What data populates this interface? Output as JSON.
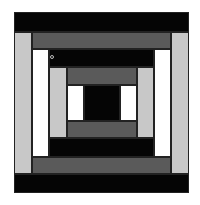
{
  "diagram": {
    "title": "",
    "type": "quilt-block-courthouse-steps",
    "colors": {
      "black": "#050505",
      "dark_gray": "#5a5a5a",
      "light_gray": "#c8c8c8",
      "white": "#ffffff"
    },
    "pieces": [
      {
        "name": "outer-top-black",
        "x": 14,
        "y": 12,
        "w": 175,
        "h": 20,
        "color": "#050505"
      },
      {
        "name": "outer-bottom-black",
        "x": 14,
        "y": 174,
        "w": 175,
        "h": 19,
        "color": "#050505"
      },
      {
        "name": "left-light-gray",
        "x": 14,
        "y": 32,
        "w": 18,
        "h": 142,
        "color": "#c8c8c8"
      },
      {
        "name": "right-light-gray",
        "x": 171,
        "y": 32,
        "w": 18,
        "h": 142,
        "color": "#c8c8c8"
      },
      {
        "name": "top-dark-gray",
        "x": 32,
        "y": 32,
        "w": 139,
        "h": 17,
        "color": "#5a5a5a"
      },
      {
        "name": "bottom-dark-gray",
        "x": 32,
        "y": 157,
        "w": 139,
        "h": 17,
        "color": "#5a5a5a"
      },
      {
        "name": "left-white",
        "x": 32,
        "y": 49,
        "w": 17,
        "h": 108,
        "color": "#ffffff"
      },
      {
        "name": "right-white",
        "x": 154,
        "y": 49,
        "w": 17,
        "h": 108,
        "color": "#ffffff"
      },
      {
        "name": "mid-top-black",
        "x": 49,
        "y": 49,
        "w": 105,
        "h": 18,
        "color": "#050505"
      },
      {
        "name": "mid-bottom-black",
        "x": 49,
        "y": 138,
        "w": 105,
        "h": 19,
        "color": "#050505"
      },
      {
        "name": "inner-left-light-gray",
        "x": 49,
        "y": 67,
        "w": 18,
        "h": 71,
        "color": "#c8c8c8"
      },
      {
        "name": "inner-right-light-gray",
        "x": 137,
        "y": 67,
        "w": 17,
        "h": 71,
        "color": "#c8c8c8"
      },
      {
        "name": "inner-top-dark-gray",
        "x": 67,
        "y": 67,
        "w": 70,
        "h": 18,
        "color": "#5a5a5a"
      },
      {
        "name": "inner-bottom-dark-gray",
        "x": 67,
        "y": 121,
        "w": 70,
        "h": 17,
        "color": "#5a5a5a"
      },
      {
        "name": "inner-left-white",
        "x": 67,
        "y": 85,
        "w": 17,
        "h": 36,
        "color": "#ffffff"
      },
      {
        "name": "inner-right-white",
        "x": 120,
        "y": 85,
        "w": 17,
        "h": 36,
        "color": "#ffffff"
      },
      {
        "name": "center-black",
        "x": 84,
        "y": 85,
        "w": 36,
        "h": 36,
        "color": "#050505"
      }
    ],
    "marker": {
      "x": 50,
      "y": 55
    }
  }
}
